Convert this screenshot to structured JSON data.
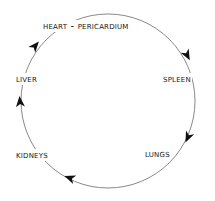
{
  "diagram": {
    "type": "cycle",
    "direction": "clockwise",
    "stroke_color": "#7a7a7a",
    "arrow_color": "#111111",
    "text_color": "#151515",
    "nodes": [
      {
        "id": "heart",
        "label": "Heart - Pericardium"
      },
      {
        "id": "spleen",
        "label": "Spleen"
      },
      {
        "id": "lungs",
        "label": "Lungs"
      },
      {
        "id": "kidneys",
        "label": "Kidneys"
      },
      {
        "id": "liver",
        "label": "Liver"
      }
    ],
    "edges": [
      {
        "from": "Heart - Pericardium",
        "to": "Spleen"
      },
      {
        "from": "Spleen",
        "to": "Lungs"
      },
      {
        "from": "Lungs",
        "to": "Kidneys"
      },
      {
        "from": "Kidneys",
        "to": "Liver"
      },
      {
        "from": "Liver",
        "to": "Heart - Pericardium"
      }
    ]
  }
}
